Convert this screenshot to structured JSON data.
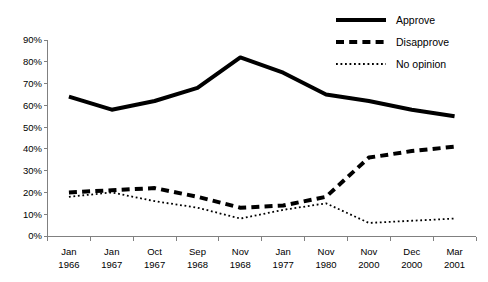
{
  "chart_data": {
    "type": "line",
    "title": "",
    "subtitle": "",
    "xlabel": "",
    "ylabel": "",
    "grid": false,
    "legend_position": "top-right",
    "ylim": [
      0,
      90
    ],
    "ytick_labels": [
      "0%",
      "10%",
      "20%",
      "30%",
      "40%",
      "50%",
      "60%",
      "70%",
      "80%",
      "90%"
    ],
    "ytick_values": [
      0,
      10,
      20,
      30,
      40,
      50,
      60,
      70,
      80,
      90
    ],
    "categories": [
      "Jan\n1966",
      "Jan\n1967",
      "Oct\n1967",
      "Sep\n1968",
      "Nov\n1968",
      "Jan\n1977",
      "Nov\n1980",
      "Nov\n2000",
      "Dec\n2000",
      "Mar\n2001"
    ],
    "category_months": [
      "Jan",
      "Jan",
      "Oct",
      "Sep",
      "Nov",
      "Jan",
      "Nov",
      "Nov",
      "Dec",
      "Mar"
    ],
    "category_years": [
      "1966",
      "1967",
      "1967",
      "1968",
      "1968",
      "1977",
      "1980",
      "2000",
      "2000",
      "2001"
    ],
    "series": [
      {
        "name": "Approve",
        "style": "solid",
        "color": "#000000",
        "width": 4,
        "values": [
          64,
          58,
          62,
          68,
          82,
          75,
          65,
          62,
          58,
          55
        ]
      },
      {
        "name": "Disapprove",
        "style": "dashed",
        "color": "#000000",
        "width": 4,
        "values": [
          20,
          21,
          22,
          18,
          13,
          14,
          18,
          36,
          39,
          41
        ]
      },
      {
        "name": "No opinion",
        "style": "dotted",
        "color": "#000000",
        "width": 1.8,
        "values": [
          18,
          20,
          16,
          13,
          8,
          12,
          15,
          6,
          7,
          8
        ]
      }
    ]
  },
  "legend": {
    "items": [
      {
        "label": "Approve",
        "style": "solid"
      },
      {
        "label": "Disapprove",
        "style": "dashed"
      },
      {
        "label": "No opinion",
        "style": "dotted"
      }
    ]
  }
}
